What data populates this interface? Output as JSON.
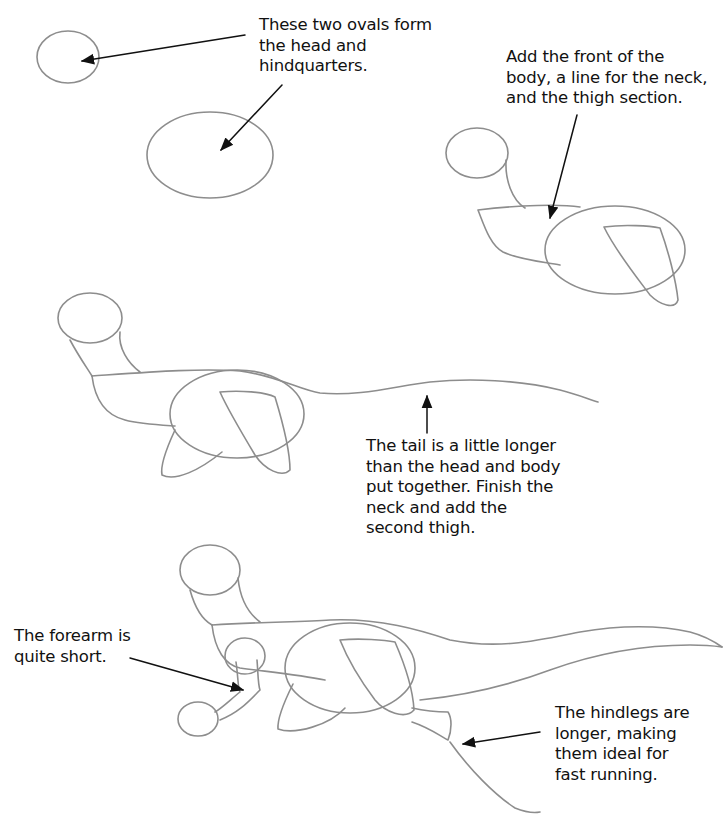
{
  "captions": {
    "step1": {
      "lines": [
        "These two ovals form",
        "the head and",
        "hindquarters."
      ]
    },
    "step2": {
      "lines": [
        "Add the front of the",
        "body, a line for the neck,",
        "and the thigh section."
      ]
    },
    "step3": {
      "lines": [
        "The tail is a little longer",
        "than the head and body",
        "put together. Finish the",
        "neck and add the",
        "second thigh."
      ]
    },
    "step4_forearm": {
      "lines": [
        "The forearm is",
        "quite short."
      ]
    },
    "step4_hindlegs": {
      "lines": [
        "The hindlegs are",
        "longer, making",
        "them ideal for",
        "fast running."
      ]
    }
  },
  "style": {
    "pencil_color": "#8d8d8d",
    "ink_color": "#111111",
    "background": "#ffffff"
  }
}
